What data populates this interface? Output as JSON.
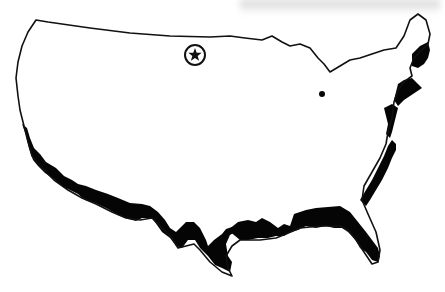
{
  "map": {
    "subject": "Contiguous United States outline map",
    "highlight": "Coastal regions shaded black along Pacific, Gulf and Atlantic coasts",
    "marker": {
      "icon": "star-in-circle-icon",
      "location": "North Dakota"
    },
    "colors": {
      "background": "#ffffff",
      "state_fill": "#ffffff",
      "border": "#111111",
      "coastal_highlight": "#050505",
      "top_shadow": "#c8c8c8"
    }
  }
}
